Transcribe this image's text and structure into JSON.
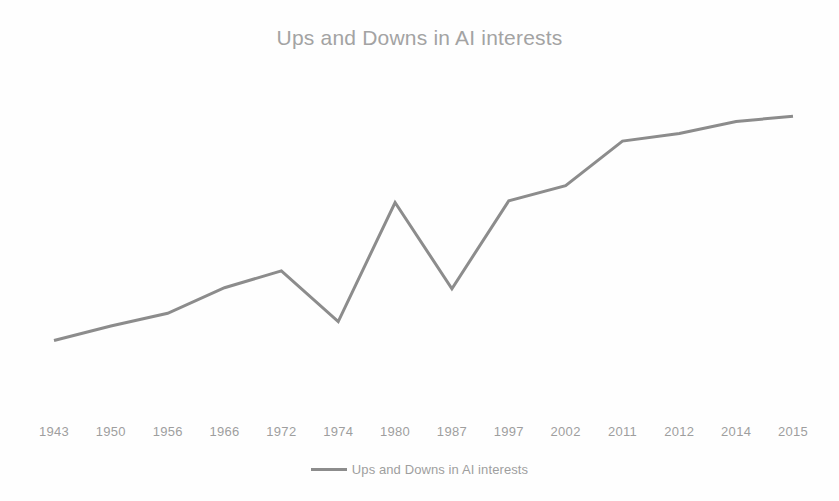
{
  "chart_data": {
    "type": "line",
    "title": "Ups and Downs in AI interests",
    "xlabel": "",
    "ylabel": "",
    "grid": false,
    "legend_position": "bottom-center",
    "ylim": [
      0,
      8
    ],
    "categories": [
      "1943",
      "1950",
      "1956",
      "1966",
      "1972",
      "1974",
      "1980",
      "1987",
      "1997",
      "2002",
      "2011",
      "2012",
      "2014",
      "2015"
    ],
    "series": [
      {
        "name": "Ups and Downs in AI interests",
        "color": "#8c8c8c",
        "values": [
          1.0,
          1.42,
          1.79,
          2.53,
          3.02,
          1.55,
          5.0,
          2.5,
          5.05,
          5.49,
          6.78,
          7.0,
          7.35,
          7.5
        ]
      }
    ],
    "axis_label_color": "#9e9e9e",
    "title_color": "#a3a3a3",
    "background_color": "#fefefe"
  },
  "legend": {
    "items": [
      {
        "label": "Ups and Downs in AI interests"
      }
    ]
  }
}
